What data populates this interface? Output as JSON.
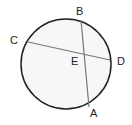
{
  "diagram": {
    "type": "circle-chords",
    "circle": {
      "cx": 66,
      "cy": 64,
      "r": 45,
      "stroke": "#222222",
      "fill": "#f7f7f7"
    },
    "chords": [
      {
        "name": "AB",
        "x1": 81,
        "y1": 20,
        "x2": 89,
        "y2": 107
      },
      {
        "name": "CD",
        "x1": 28,
        "y1": 42,
        "x2": 110,
        "y2": 60
      }
    ],
    "labels": {
      "A": "A",
      "B": "B",
      "C": "C",
      "D": "D",
      "E": "E"
    }
  }
}
